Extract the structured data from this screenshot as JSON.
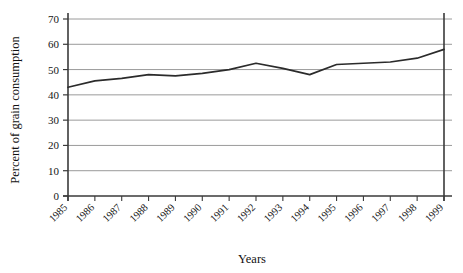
{
  "chart_data": {
    "type": "line",
    "title": "",
    "xlabel": "Years",
    "ylabel": "Percent of grain consumption",
    "categories": [
      "1985",
      "1986",
      "1987",
      "1988",
      "1989",
      "1990",
      "1991",
      "1992",
      "1993",
      "1994",
      "1995",
      "1996",
      "1997",
      "1998",
      "1999"
    ],
    "values": [
      43,
      45.5,
      46.5,
      48,
      47.5,
      48.5,
      50,
      52.5,
      50.5,
      48,
      52,
      52.5,
      53,
      54.5,
      58
    ],
    "series": [
      {
        "name": "Percent of grain consumption",
        "values": [
          43,
          45.5,
          46.5,
          48,
          47.5,
          48.5,
          50,
          52.5,
          50.5,
          48,
          52,
          52.5,
          53,
          54.5,
          58
        ]
      }
    ],
    "ylim": [
      0,
      70
    ],
    "ytick_labels": [
      "0",
      "10",
      "20",
      "30",
      "40",
      "50",
      "60",
      "70"
    ],
    "ytick_values": [
      0,
      10,
      20,
      30,
      40,
      50,
      60,
      70
    ],
    "grid": "horizontal",
    "legend": "none",
    "line_color": "#2b2b2b",
    "grid_color": "#9a9a9a",
    "axis_color": "#3a3a3a",
    "background": "#ffffff"
  },
  "axis_titles": {
    "x": "Years",
    "y": "Percent of grain consumption"
  }
}
